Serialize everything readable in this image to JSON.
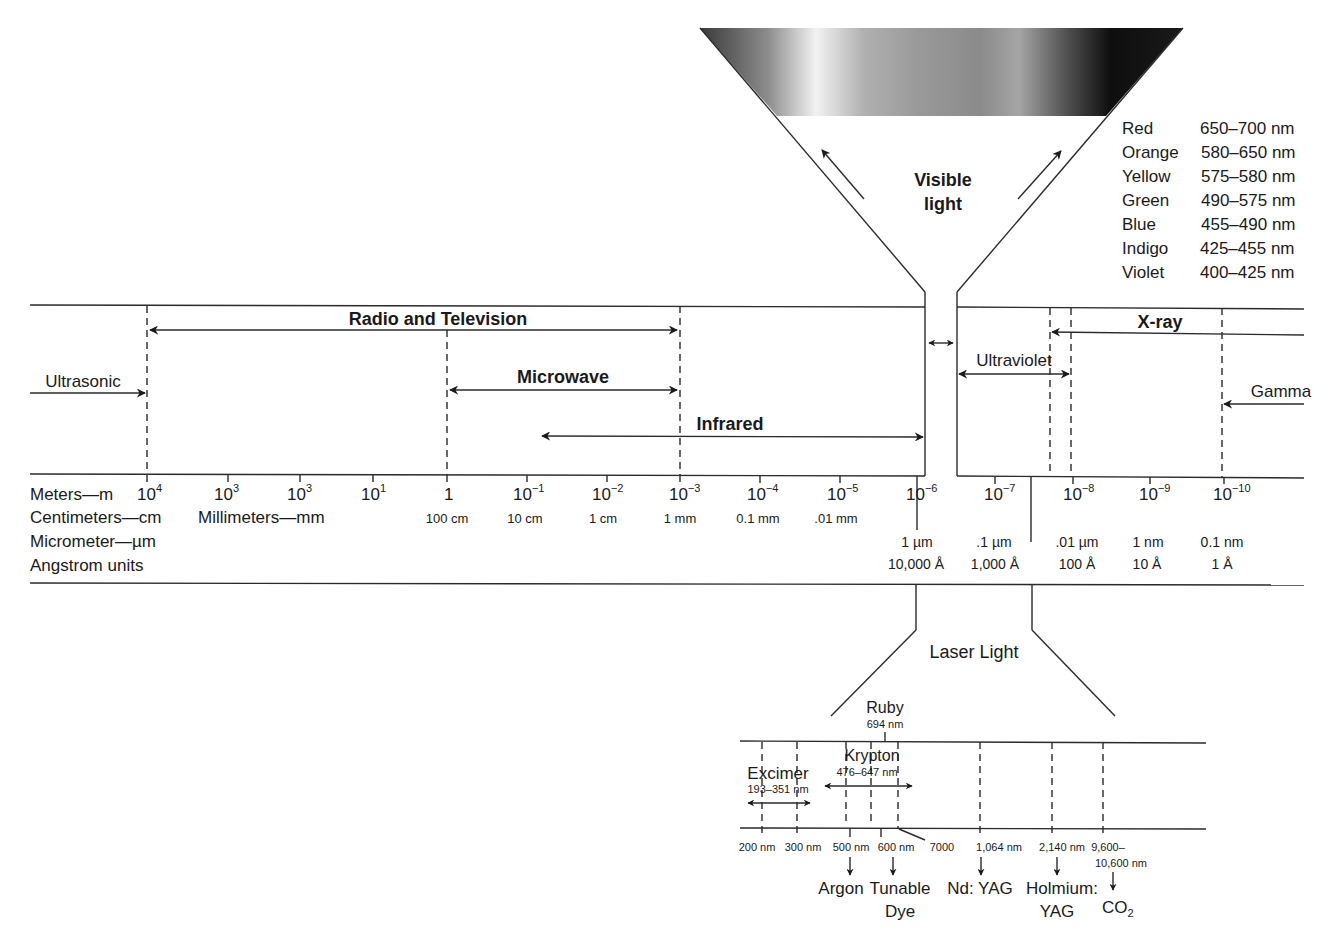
{
  "visible_light": {
    "label_line1": "Visible",
    "label_line2": "light",
    "colors": [
      {
        "name": "Red",
        "range": "650–700 nm"
      },
      {
        "name": "Orange",
        "range": "580–650 nm"
      },
      {
        "name": "Yellow",
        "range": "575–580 nm"
      },
      {
        "name": "Green",
        "range": "490–575 nm"
      },
      {
        "name": "Blue",
        "range": "455–490 nm"
      },
      {
        "name": "Indigo",
        "range": "425–455 nm"
      },
      {
        "name": "Violet",
        "range": "400–425 nm"
      }
    ]
  },
  "bands": {
    "radio_tv": "Radio and Television",
    "microwave": "Microwave",
    "infrared": "Infrared",
    "ultrasonic": "Ultrasonic",
    "ultraviolet": "Ultraviolet",
    "xray": "X-ray",
    "gamma": "Gamma"
  },
  "scale": {
    "row_labels": {
      "meters": "Meters—m",
      "centimeters": "Centimeters—cm",
      "millimeters": "Millimeters—mm",
      "micrometer": "Micrometer—µm",
      "angstrom": "Angstrom units"
    },
    "meters": [
      {
        "base": "10",
        "exp": "4"
      },
      {
        "base": "10",
        "exp": "3"
      },
      {
        "base": "10",
        "exp": "3"
      },
      {
        "base": "10",
        "exp": "1"
      },
      {
        "base": "1",
        "exp": ""
      },
      {
        "base": "10",
        "exp": "−1"
      },
      {
        "base": "10",
        "exp": "−2"
      },
      {
        "base": "10",
        "exp": "−3"
      },
      {
        "base": "10",
        "exp": "−4"
      },
      {
        "base": "10",
        "exp": "−5"
      },
      {
        "base": "10",
        "exp": "−6"
      },
      {
        "base": "10",
        "exp": "−7"
      },
      {
        "base": "10",
        "exp": "−8"
      },
      {
        "base": "10",
        "exp": "−9"
      },
      {
        "base": "10",
        "exp": "−10"
      }
    ],
    "cm_mm": [
      "100 cm",
      "10 cm",
      "1 cm",
      "1 mm",
      "0.1 mm",
      ".01 mm"
    ],
    "micrometer": [
      "1 µm",
      ".1 µm",
      ".01 µm",
      "1 nm",
      "0.1 nm"
    ],
    "angstrom": [
      "10,000 Å",
      "1,000 Å",
      "100 Å",
      "10 Å",
      "1 Å"
    ]
  },
  "laser": {
    "title": "Laser Light",
    "ruby": {
      "name": "Ruby",
      "wavelength": "694 nm"
    },
    "krypton": {
      "name": "Krypton",
      "range": "476–647 nm"
    },
    "excimer": {
      "name": "Excimer",
      "range": "193–351 nm"
    },
    "ticks": [
      "200 nm",
      "300 nm",
      "500 nm",
      "600 nm",
      "7000",
      "1,064 nm",
      "2,140 nm",
      "9,600–",
      "10,600 nm"
    ],
    "lasers": {
      "argon": "Argon",
      "tunable": "Tunable",
      "dye": "Dye",
      "ndyag": "Nd: YAG",
      "holmium": "Holmium:",
      "holmium_yag": "YAG",
      "co2_base": "CO",
      "co2_sub": "2"
    }
  }
}
